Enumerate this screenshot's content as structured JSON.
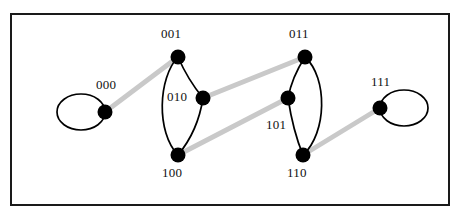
{
  "figure": {
    "background_color": "#ffffff",
    "border": {
      "name": "figure-border",
      "color": "#1a1a1a",
      "x": 10,
      "y": 13,
      "width": 440,
      "height": 193,
      "stroke_width": 2
    }
  },
  "style": {
    "node_color": "#000000",
    "node_radius": 7,
    "black_edge_color": "#000000",
    "black_edge_width": 1.6,
    "gray_edge_color": "#c9c9c9",
    "gray_edge_width": 4.5,
    "loop_stroke_width": 1.6,
    "label_color": "#111111",
    "label_font_size": 13
  },
  "graph_data": {
    "type": "diagram",
    "node_count": 8,
    "nodes": [
      {
        "id": "000",
        "label": "000",
        "x": 105,
        "y": 112,
        "label_x": 96,
        "label_y": 78
      },
      {
        "id": "001",
        "label": "001",
        "x": 178,
        "y": 57,
        "label_x": 161,
        "label_y": 27
      },
      {
        "id": "010",
        "label": "010",
        "x": 203,
        "y": 98,
        "label_x": 167,
        "label_y": 89
      },
      {
        "id": "011",
        "label": "011",
        "x": 305,
        "y": 57,
        "label_x": 289,
        "label_y": 27
      },
      {
        "id": "100",
        "label": "100",
        "x": 178,
        "y": 155,
        "label_x": 162,
        "label_y": 166
      },
      {
        "id": "101",
        "label": "101",
        "x": 288,
        "y": 98,
        "label_x": 266,
        "label_y": 117
      },
      {
        "id": "110",
        "label": "110",
        "x": 303,
        "y": 155,
        "label_x": 287,
        "label_y": 166
      },
      {
        "id": "111",
        "label": "111",
        "x": 380,
        "y": 108,
        "label_x": 371,
        "label_y": 75
      }
    ],
    "edges": [
      {
        "id": "e-000-001",
        "from": "000",
        "to": "001",
        "color": "gray",
        "shape": "straight"
      },
      {
        "id": "e-010-011",
        "from": "010",
        "to": "011",
        "color": "gray",
        "shape": "straight"
      },
      {
        "id": "e-100-101",
        "from": "100",
        "to": "101",
        "color": "gray",
        "shape": "straight"
      },
      {
        "id": "e-110-111",
        "from": "110",
        "to": "111",
        "color": "gray",
        "shape": "straight"
      },
      {
        "id": "e-001-010",
        "from": "001",
        "to": "010",
        "color": "black",
        "shape": "curve"
      },
      {
        "id": "e-010-100",
        "from": "010",
        "to": "100",
        "color": "black",
        "shape": "curve"
      },
      {
        "id": "e-001-100",
        "from": "001",
        "to": "100",
        "color": "black",
        "shape": "arc-left"
      },
      {
        "id": "e-011-101",
        "from": "011",
        "to": "101",
        "color": "black",
        "shape": "curve"
      },
      {
        "id": "e-101-110",
        "from": "101",
        "to": "110",
        "color": "black",
        "shape": "curve"
      },
      {
        "id": "e-011-110",
        "from": "011",
        "to": "110",
        "color": "black",
        "shape": "arc-right"
      }
    ],
    "self_loops": [
      {
        "id": "loop-000",
        "node": "000",
        "color": "black",
        "side": "left",
        "cx": 81,
        "cy": 112,
        "rx": 24,
        "ry": 18
      },
      {
        "id": "loop-111",
        "node": "111",
        "color": "black",
        "side": "right",
        "cx": 404,
        "cy": 108,
        "rx": 24,
        "ry": 18
      }
    ]
  }
}
